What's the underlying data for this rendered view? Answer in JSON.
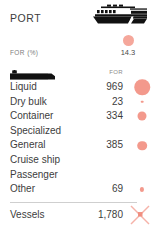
{
  "header": {
    "title": "PORT",
    "icon": "cargo-ship-icon"
  },
  "kpi": {
    "label": "FOR (%)",
    "value": "14.3",
    "dot_color": "#f5a79b"
  },
  "table": {
    "columns": {
      "category_icon": "cargo-truck-icon",
      "value_header": "FOR"
    },
    "rows": [
      {
        "label": "Liquid",
        "value": "969",
        "bubble": 15.5
      },
      {
        "label": "Dry bulk",
        "value": "23",
        "bubble": 2.6
      },
      {
        "label": "Container",
        "value": "334",
        "bubble": 9.0
      },
      {
        "label": "Specialized",
        "value": "",
        "bubble": 0
      },
      {
        "label": "General",
        "value": "385",
        "bubble": 9.6
      },
      {
        "label": "Cruise ship",
        "value": "",
        "bubble": 0
      },
      {
        "label": "Passenger",
        "value": "",
        "bubble": 0
      },
      {
        "label": "Other",
        "value": "69",
        "bubble": 4.2
      }
    ]
  },
  "footer": {
    "label": "Vessels",
    "value": "1,780",
    "marker": "x-marker-icon"
  },
  "colors": {
    "bubble": "#f3998c",
    "accent": "#f5a79b",
    "text": "#3d3d3d",
    "muted": "#8a8a8a",
    "rule": "#cfcfcf"
  }
}
